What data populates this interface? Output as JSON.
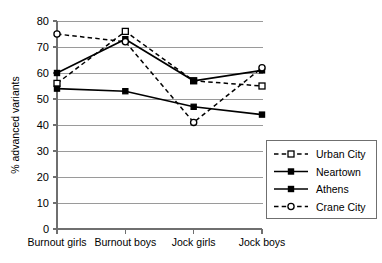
{
  "chart_data": {
    "type": "line",
    "title": "",
    "xlabel": "",
    "ylabel": "% advanced variants",
    "ylim": [
      0,
      80
    ],
    "yticks": [
      0,
      10,
      20,
      30,
      40,
      50,
      60,
      70,
      80
    ],
    "grid": true,
    "legend_position": "right-lower",
    "categories": [
      "Burnout girls",
      "Burnout boys",
      "Jock girls",
      "Jock boys"
    ],
    "series": [
      {
        "name": "Urban City",
        "values": [
          56,
          76,
          57,
          55
        ],
        "line_style": "dashed",
        "marker": "open-square",
        "color": "#000000"
      },
      {
        "name": "Neartown",
        "values": [
          54,
          53,
          47,
          44
        ],
        "line_style": "solid",
        "marker": "filled-square",
        "color": "#000000"
      },
      {
        "name": "Athens",
        "values": [
          60,
          73,
          57,
          61
        ],
        "line_style": "solid",
        "marker": "filled-square",
        "color": "#000000"
      },
      {
        "name": "Crane City",
        "values": [
          75,
          72,
          41,
          62
        ],
        "line_style": "dashed",
        "marker": "open-circle",
        "color": "#000000"
      }
    ]
  },
  "axis": {
    "y_title": "% advanced variants",
    "y_tick_labels": [
      "0",
      "10",
      "20",
      "30",
      "40",
      "50",
      "60",
      "70",
      "80"
    ],
    "x_tick_labels": [
      "Burnout girls",
      "Burnout boys",
      "Jock girls",
      "Jock boys"
    ]
  },
  "legend": {
    "entries": [
      {
        "label": "Urban City"
      },
      {
        "label": "Neartown"
      },
      {
        "label": "Athens"
      },
      {
        "label": "Crane City"
      }
    ]
  },
  "colors": {
    "plot_background": "#ffffff",
    "gridline": "#9a9a9a",
    "axis": "#6f6f6f",
    "series": "#000000",
    "legend_border": "#6f6f6f"
  }
}
